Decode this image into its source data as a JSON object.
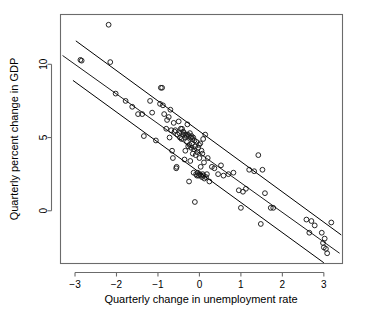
{
  "chart_data": {
    "type": "scatter",
    "title": "",
    "xlabel": "Quarterly change in unemployment rate",
    "ylabel": "Quarterly percent change in GDP",
    "xlim": [
      -3.35,
      3.45
    ],
    "ylim": [
      -3.6,
      13.4
    ],
    "xticks": [
      -3,
      -2,
      -1,
      0,
      1,
      2,
      3
    ],
    "xticklabels": [
      "−3",
      "−2",
      "−1",
      "0",
      "1",
      "2",
      "3"
    ],
    "yticks": [
      0,
      5,
      10
    ],
    "yticklabels": [
      "0",
      "5",
      "10"
    ],
    "grid": false,
    "legend": null,
    "marker": "open-circle",
    "marker_color": "#1a1a1a",
    "frame_color": "#6b6b6b",
    "points": [
      [
        -2.87,
        10.3
      ],
      [
        -2.84,
        10.25
      ],
      [
        -2.19,
        12.7
      ],
      [
        -2.15,
        10.15
      ],
      [
        -2.02,
        8.0
      ],
      [
        -1.78,
        7.5
      ],
      [
        -1.62,
        7.1
      ],
      [
        -1.48,
        6.6
      ],
      [
        -1.38,
        6.6
      ],
      [
        -1.34,
        5.1
      ],
      [
        -1.19,
        7.5
      ],
      [
        -1.14,
        6.7
      ],
      [
        -1.05,
        4.8
      ],
      [
        -0.95,
        7.3
      ],
      [
        -0.93,
        8.4
      ],
      [
        -0.9,
        8.4
      ],
      [
        -0.88,
        7.2
      ],
      [
        -0.85,
        6.6
      ],
      [
        -0.8,
        5.6
      ],
      [
        -0.78,
        6.2
      ],
      [
        -0.74,
        6.4
      ],
      [
        -0.72,
        5.0
      ],
      [
        -0.7,
        6.9
      ],
      [
        -0.68,
        5.5
      ],
      [
        -0.66,
        4.1
      ],
      [
        -0.64,
        3.6
      ],
      [
        -0.62,
        6.0
      ],
      [
        -0.6,
        5.4
      ],
      [
        -0.58,
        5.5
      ],
      [
        -0.56,
        2.9
      ],
      [
        -0.55,
        3.0
      ],
      [
        -0.53,
        5.2
      ],
      [
        -0.5,
        6.1
      ],
      [
        -0.48,
        5.3
      ],
      [
        -0.47,
        5.0
      ],
      [
        -0.45,
        5.6
      ],
      [
        -0.43,
        4.9
      ],
      [
        -0.42,
        5.6
      ],
      [
        -0.4,
        5.2
      ],
      [
        -0.39,
        5.4
      ],
      [
        -0.37,
        5.3
      ],
      [
        -0.36,
        3.5
      ],
      [
        -0.35,
        5.0
      ],
      [
        -0.34,
        4.1
      ],
      [
        -0.33,
        5.2
      ],
      [
        -0.31,
        5.1
      ],
      [
        -0.3,
        4.7
      ],
      [
        -0.29,
        5.9
      ],
      [
        -0.28,
        5.2
      ],
      [
        -0.27,
        4.4
      ],
      [
        -0.26,
        5.1
      ],
      [
        -0.25,
        2.0
      ],
      [
        -0.24,
        4.5
      ],
      [
        -0.23,
        5.3
      ],
      [
        -0.22,
        3.4
      ],
      [
        -0.21,
        5.0
      ],
      [
        -0.2,
        4.3
      ],
      [
        -0.19,
        5.1
      ],
      [
        -0.18,
        4.6
      ],
      [
        -0.17,
        4.9
      ],
      [
        -0.16,
        3.9
      ],
      [
        -0.15,
        5.0
      ],
      [
        -0.14,
        2.6
      ],
      [
        -0.13,
        4.2
      ],
      [
        -0.12,
        4.8
      ],
      [
        -0.11,
        0.6
      ],
      [
        -0.1,
        4.4
      ],
      [
        -0.09,
        3.8
      ],
      [
        -0.08,
        2.5
      ],
      [
        -0.07,
        4.7
      ],
      [
        -0.06,
        2.4
      ],
      [
        -0.05,
        4.0
      ],
      [
        -0.04,
        2.6
      ],
      [
        -0.03,
        4.3
      ],
      [
        -0.02,
        2.4
      ],
      [
        -0.01,
        4.5
      ],
      [
        0.0,
        3.6
      ],
      [
        0.01,
        2.5
      ],
      [
        0.02,
        4.6
      ],
      [
        0.03,
        3.0
      ],
      [
        0.04,
        2.4
      ],
      [
        0.05,
        4.1
      ],
      [
        0.06,
        2.3
      ],
      [
        0.07,
        3.9
      ],
      [
        0.08,
        2.5
      ],
      [
        0.09,
        4.9
      ],
      [
        0.1,
        2.4
      ],
      [
        0.11,
        3.3
      ],
      [
        0.12,
        2.2
      ],
      [
        0.14,
        5.2
      ],
      [
        0.16,
        2.3
      ],
      [
        0.18,
        2.5
      ],
      [
        0.2,
        3.6
      ],
      [
        0.24,
        2.0
      ],
      [
        0.3,
        3.0
      ],
      [
        0.36,
        2.9
      ],
      [
        0.45,
        2.5
      ],
      [
        0.52,
        3.1
      ],
      [
        0.58,
        2.4
      ],
      [
        0.7,
        2.5
      ],
      [
        0.82,
        2.6
      ],
      [
        0.95,
        1.4
      ],
      [
        1.0,
        0.2
      ],
      [
        1.05,
        1.3
      ],
      [
        1.12,
        1.5
      ],
      [
        1.2,
        2.8
      ],
      [
        1.32,
        2.7
      ],
      [
        1.42,
        3.8
      ],
      [
        1.48,
        -0.9
      ],
      [
        1.52,
        2.8
      ],
      [
        1.58,
        1.2
      ],
      [
        1.72,
        0.2
      ],
      [
        1.78,
        0.2
      ],
      [
        2.58,
        -0.6
      ],
      [
        2.65,
        -1.5
      ],
      [
        2.7,
        -0.7
      ],
      [
        2.78,
        -1.0
      ],
      [
        2.95,
        -1.5
      ],
      [
        2.98,
        -2.2
      ],
      [
        3.0,
        -2.5
      ],
      [
        3.02,
        -1.9
      ],
      [
        3.05,
        -2.6
      ],
      [
        3.08,
        -2.9
      ],
      [
        3.18,
        -0.8
      ]
    ],
    "fit_lines": [
      {
        "name": "upper-fit",
        "x1": -2.98,
        "y1": 11.6,
        "x2": 3.42,
        "y2": -1.65,
        "stroke_width": 1.0
      },
      {
        "name": "middle-fit",
        "x1": -3.3,
        "y1": 10.6,
        "x2": 3.38,
        "y2": -2.9,
        "stroke_width": 0.9
      },
      {
        "name": "lower-fit",
        "x1": -3.05,
        "y1": 8.9,
        "x2": 3.0,
        "y2": -3.55,
        "stroke_width": 1.0
      }
    ]
  }
}
